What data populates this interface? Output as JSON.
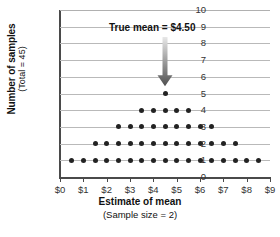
{
  "chart_data": {
    "type": "scatter",
    "plot_style": "dot-plot",
    "title": "",
    "xlabel": "Estimate of mean",
    "xlabel_sub": "(Sample size = 2)",
    "ylabel": "Number of samples",
    "ylabel_sub": "(Total = 45)",
    "xlim": [
      0,
      9
    ],
    "ylim": [
      0,
      10
    ],
    "grid": true,
    "legend": "none",
    "x_tick_labels": [
      "$0",
      "$1",
      "$2",
      "$3",
      "$4",
      "$5",
      "$6",
      "$7",
      "$8",
      "$9"
    ],
    "x_tick_values": [
      0,
      1,
      2,
      3,
      4,
      5,
      6,
      7,
      8,
      9
    ],
    "y_tick_labels": [
      "0",
      "1",
      "2",
      "3",
      "4",
      "5",
      "6",
      "7",
      "8",
      "9",
      "10"
    ],
    "y_tick_values": [
      0,
      1,
      2,
      3,
      4,
      5,
      6,
      7,
      8,
      9,
      10
    ],
    "total_samples": 45,
    "dot_color": "#222222",
    "grid_color": "#b9b9b9",
    "axis_color": "#4a4a4a",
    "stacks": [
      {
        "x": 0.5,
        "count": 1
      },
      {
        "x": 1.0,
        "count": 1
      },
      {
        "x": 1.5,
        "count": 2
      },
      {
        "x": 2.0,
        "count": 2
      },
      {
        "x": 2.5,
        "count": 3
      },
      {
        "x": 3.0,
        "count": 3
      },
      {
        "x": 3.5,
        "count": 4
      },
      {
        "x": 4.0,
        "count": 4
      },
      {
        "x": 4.5,
        "count": 5
      },
      {
        "x": 5.0,
        "count": 4
      },
      {
        "x": 5.5,
        "count": 4
      },
      {
        "x": 6.0,
        "count": 3
      },
      {
        "x": 6.5,
        "count": 3
      },
      {
        "x": 7.0,
        "count": 2
      },
      {
        "x": 7.5,
        "count": 2
      },
      {
        "x": 8.0,
        "count": 1
      },
      {
        "x": 8.5,
        "count": 1
      }
    ],
    "rows": [
      {
        "y": 1,
        "dots": 17,
        "x_from": 0.5,
        "x_to": 8.5
      },
      {
        "y": 2,
        "dots": 13,
        "x_from": 1.5,
        "x_to": 7.5
      },
      {
        "y": 3,
        "dots": 9,
        "x_from": 2.5,
        "x_to": 6.5
      },
      {
        "y": 4,
        "dots": 5,
        "x_from": 3.5,
        "x_to": 5.5
      },
      {
        "y": 5,
        "dots": 1,
        "x_from": 4.5,
        "x_to": 4.5
      }
    ],
    "annotations": [
      {
        "text": "True mean  =  $4.50",
        "label_text": "True mean",
        "equals": "=",
        "value": "$4.50",
        "x": 4.5,
        "arrow_from_y": 8.4,
        "arrow_to_y": 5.45,
        "arrow_color_top": "#e8e8e8",
        "arrow_color_bottom": "#4f4f4f"
      }
    ]
  }
}
